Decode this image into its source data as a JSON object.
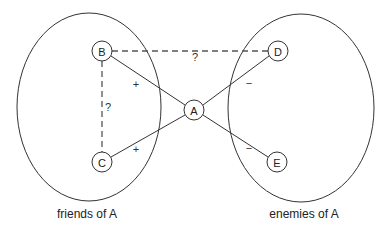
{
  "diagram": {
    "type": "signed-graph",
    "groups": [
      {
        "id": "friends",
        "label": "friends of A",
        "cx": 89,
        "cy": 107,
        "rx": 72,
        "ry": 94
      },
      {
        "id": "enemies",
        "label": "enemies of A",
        "cx": 301,
        "cy": 108,
        "rx": 73,
        "ry": 94
      }
    ],
    "nodes": [
      {
        "id": "A",
        "label": "A",
        "x": 194,
        "y": 110
      },
      {
        "id": "B",
        "label": "B",
        "x": 102,
        "y": 51
      },
      {
        "id": "C",
        "label": "C",
        "x": 102,
        "y": 162
      },
      {
        "id": "D",
        "label": "D",
        "x": 278,
        "y": 51
      },
      {
        "id": "E",
        "label": "E",
        "x": 277,
        "y": 162
      }
    ],
    "edges": [
      {
        "from": "A",
        "to": "B",
        "sign": "+",
        "style": "solid",
        "label_x": 136,
        "label_y": 84
      },
      {
        "from": "A",
        "to": "C",
        "sign": "+",
        "style": "solid",
        "label_x": 136,
        "label_y": 149
      },
      {
        "from": "A",
        "to": "D",
        "sign": "−",
        "style": "solid",
        "label_x": 249,
        "label_y": 83
      },
      {
        "from": "A",
        "to": "E",
        "sign": "−",
        "style": "solid",
        "label_x": 249,
        "label_y": 148
      },
      {
        "from": "B",
        "to": "D",
        "sign": "?",
        "style": "dashed",
        "label_x": 195,
        "label_y": 57
      },
      {
        "from": "B",
        "to": "C",
        "sign": "?",
        "style": "dashed",
        "label_x": 108,
        "label_y": 107
      }
    ],
    "captions": {
      "friends": "friends of A",
      "enemies": "enemies of A"
    }
  }
}
